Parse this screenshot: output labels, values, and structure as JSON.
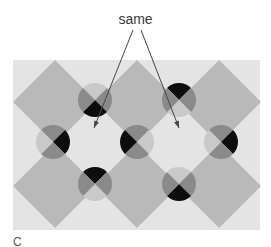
{
  "figure": {
    "annotation": "same",
    "panel_label": "C",
    "colors": {
      "page_background": "#ffffff",
      "field": "#e4e4e4",
      "diamond": "#b9b9b9",
      "light": "#c9c9c9",
      "mid": "#8a8a8a",
      "dark": "#0d0d0d",
      "arrow": "#444444"
    },
    "field_rect": {
      "x": 13,
      "y": 60,
      "width": 247,
      "height": 170
    },
    "diamonds": [
      {
        "cx": 55,
        "cy": 102,
        "r": 42
      },
      {
        "cx": 137,
        "cy": 102,
        "r": 42
      },
      {
        "cx": 219,
        "cy": 102,
        "r": 42
      },
      {
        "cx": 55,
        "cy": 186,
        "r": 42
      },
      {
        "cx": 137,
        "cy": 186,
        "r": 42
      },
      {
        "cx": 219,
        "cy": 186,
        "r": 42
      }
    ],
    "discs": [
      {
        "name": "disc-top-left",
        "cx": 95,
        "cy": 100,
        "quadrants": {
          "top": "light",
          "right": "mid",
          "bottom": "dark",
          "left": "mid"
        }
      },
      {
        "name": "disc-top-right",
        "cx": 179,
        "cy": 100,
        "quadrants": {
          "top": "dark",
          "right": "mid",
          "bottom": "light",
          "left": "mid"
        }
      },
      {
        "name": "disc-middle-left",
        "cx": 53,
        "cy": 142,
        "quadrants": {
          "top": "mid",
          "right": "dark",
          "bottom": "mid",
          "left": "light"
        }
      },
      {
        "name": "disc-middle-center",
        "cx": 137,
        "cy": 142,
        "quadrants": {
          "top": "mid",
          "right": "light",
          "bottom": "mid",
          "left": "dark"
        }
      },
      {
        "name": "disc-middle-right",
        "cx": 221,
        "cy": 142,
        "quadrants": {
          "top": "mid",
          "right": "dark",
          "bottom": "mid",
          "left": "light"
        }
      },
      {
        "name": "disc-bottom-left",
        "cx": 95,
        "cy": 184,
        "quadrants": {
          "top": "dark",
          "right": "mid",
          "bottom": "light",
          "left": "mid"
        }
      },
      {
        "name": "disc-bottom-right",
        "cx": 179,
        "cy": 184,
        "quadrants": {
          "top": "light",
          "right": "mid",
          "bottom": "dark",
          "left": "mid"
        }
      }
    ],
    "disc_radius": 17,
    "arrows": [
      {
        "x1": 133,
        "y1": 30,
        "x2": 94,
        "y2": 128
      },
      {
        "x1": 141,
        "y1": 30,
        "x2": 179,
        "y2": 128
      }
    ]
  }
}
